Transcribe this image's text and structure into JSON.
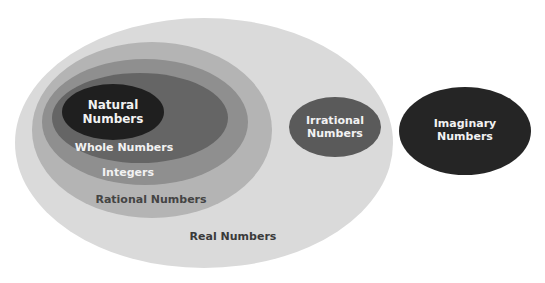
{
  "diagram": {
    "sets": {
      "real": {
        "label": "Real Numbers",
        "color": "#dadada"
      },
      "rational": {
        "label": "Rational Numbers",
        "color": "#b4b4b4"
      },
      "integers": {
        "label": "Integers",
        "color": "#8f8f8f"
      },
      "whole": {
        "label": "Whole Numbers",
        "color": "#656565"
      },
      "natural": {
        "label_line1": "Natural",
        "label_line2": "Numbers",
        "color": "#1f1f1f"
      },
      "irrational": {
        "label_line1": "Irrational",
        "label_line2": "Numbers",
        "color": "#5a5a5a"
      },
      "imaginary": {
        "label_line1": "Imaginary",
        "label_line2": "Numbers",
        "color": "#252525"
      }
    },
    "relationships": [
      "Natural Numbers ⊂ Whole Numbers",
      "Whole Numbers ⊂ Integers",
      "Integers ⊂ Rational Numbers",
      "Rational Numbers ⊂ Real Numbers",
      "Irrational Numbers ⊂ Real Numbers",
      "Imaginary Numbers outside Real Numbers"
    ]
  }
}
